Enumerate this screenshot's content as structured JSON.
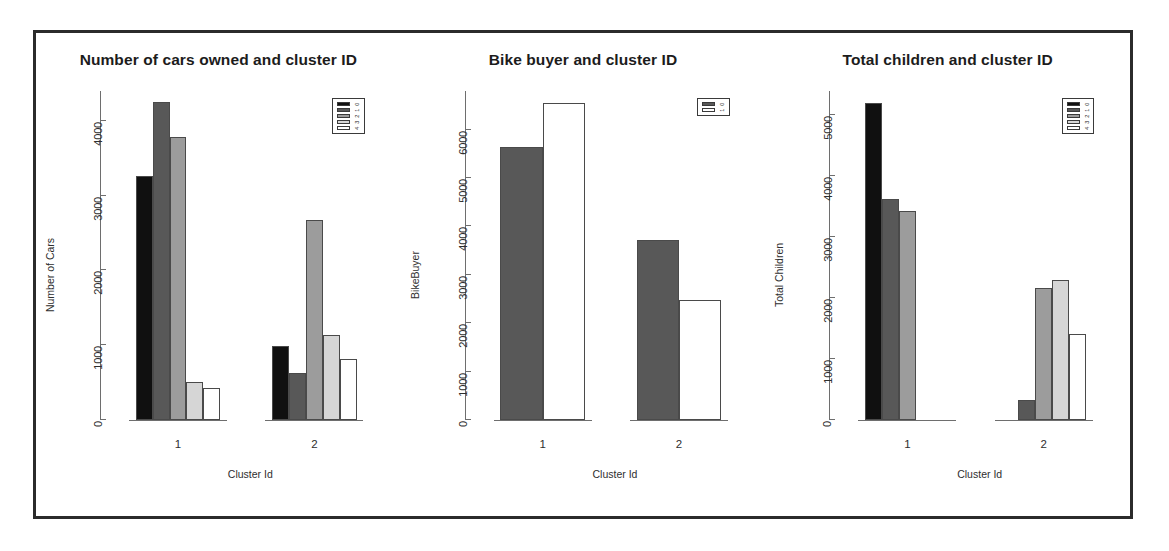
{
  "figure": {
    "background_color": "#ffffff",
    "frame_color": "#2b2b2b",
    "panel_count": 3
  },
  "palette": {
    "level0": "#101010",
    "level1": "#585858",
    "level2": "#9c9c9c",
    "level3": "#d6d6d6",
    "level4": "#ffffff",
    "axis": "#6e6e6e",
    "bar_outline": "#4a4a4a",
    "text": "#1c1c1c"
  },
  "charts": [
    {
      "id": "cars",
      "title": "Number of cars owned and cluster ID",
      "ylabel": "Number of Cars",
      "xlabel": "Cluster Id"
    },
    {
      "id": "bike",
      "title": "Bike buyer and cluster ID",
      "ylabel": "BikeBuyer",
      "xlabel": "Cluster Id"
    },
    {
      "id": "children",
      "title": "Total children and cluster ID",
      "ylabel": "Total Children",
      "xlabel": "Cluster Id"
    }
  ],
  "chart_data": [
    {
      "type": "bar",
      "title": "Number of cars owned and cluster ID",
      "xlabel": "Cluster Id",
      "ylabel": "Number of Cars",
      "categories": [
        "1",
        "2"
      ],
      "yticks": [
        0,
        1000,
        2000,
        3000,
        4000
      ],
      "ylim": [
        0,
        4400
      ],
      "grid": false,
      "legend": {
        "position": "top-right",
        "title": "",
        "entries": [
          "0",
          "1",
          "2",
          "3",
          "4"
        ],
        "colors": [
          "#101010",
          "#585858",
          "#9c9c9c",
          "#d6d6d6",
          "#ffffff"
        ]
      },
      "series": [
        {
          "name": "0",
          "color": "#101010",
          "values": [
            3270,
            990
          ]
        },
        {
          "name": "1",
          "color": "#585858",
          "values": [
            4250,
            630
          ]
        },
        {
          "name": "2",
          "color": "#9c9c9c",
          "values": [
            3780,
            2670
          ]
        },
        {
          "name": "3",
          "color": "#d6d6d6",
          "values": [
            510,
            1140
          ]
        },
        {
          "name": "4",
          "color": "#ffffff",
          "values": [
            430,
            820
          ]
        }
      ]
    },
    {
      "type": "bar",
      "title": "Bike buyer and cluster ID",
      "xlabel": "Cluster Id",
      "ylabel": "BikeBuyer",
      "categories": [
        "1",
        "2"
      ],
      "yticks": [
        0,
        1000,
        2000,
        3000,
        4000,
        5000,
        6000
      ],
      "ylim": [
        0,
        6800
      ],
      "grid": false,
      "legend": {
        "position": "top-right",
        "title": "",
        "entries": [
          "0",
          "1"
        ],
        "colors": [
          "#585858",
          "#ffffff"
        ]
      },
      "series": [
        {
          "name": "0",
          "color": "#585858",
          "values": [
            5640,
            3720
          ]
        },
        {
          "name": "1",
          "color": "#ffffff",
          "values": [
            6560,
            2480
          ]
        }
      ]
    },
    {
      "type": "bar",
      "title": "Total children and cluster ID",
      "xlabel": "Cluster Id",
      "ylabel": "Total Children",
      "categories": [
        "1",
        "2"
      ],
      "yticks": [
        0,
        1000,
        2000,
        3000,
        4000,
        5000
      ],
      "ylim": [
        0,
        5400
      ],
      "grid": false,
      "legend": {
        "position": "top-right",
        "title": "",
        "entries": [
          "0",
          "1",
          "2",
          "3",
          "4"
        ],
        "colors": [
          "#101010",
          "#585858",
          "#9c9c9c",
          "#d6d6d6",
          "#ffffff"
        ]
      },
      "series": [
        {
          "name": "0",
          "color": "#101010",
          "values": [
            5200,
            0
          ]
        },
        {
          "name": "1",
          "color": "#585858",
          "values": [
            3620,
            330
          ]
        },
        {
          "name": "2",
          "color": "#9c9c9c",
          "values": [
            3430,
            2170
          ]
        },
        {
          "name": "3",
          "color": "#d6d6d6",
          "values": [
            0,
            2290
          ]
        },
        {
          "name": "4",
          "color": "#ffffff",
          "values": [
            0,
            1420
          ]
        }
      ]
    }
  ]
}
